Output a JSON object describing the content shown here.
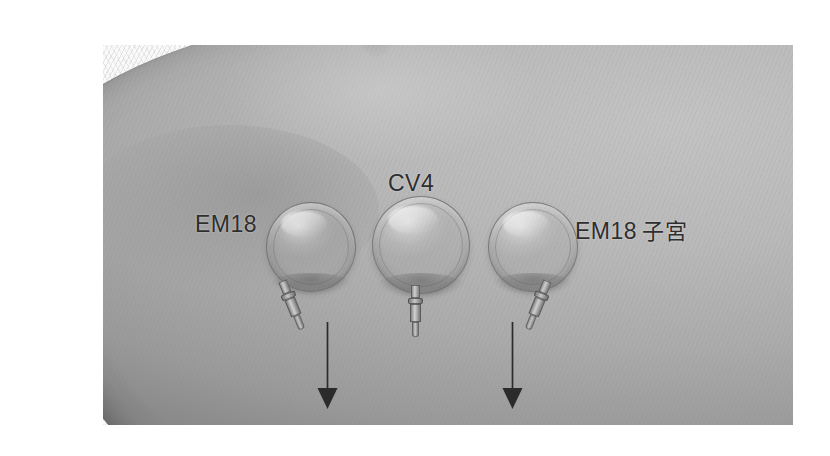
{
  "figure": {
    "kind": "clinical-photograph",
    "modality": "grayscale photo",
    "background_color": "#ffffff"
  },
  "annotations": {
    "labels": [
      {
        "id": "label-left",
        "text": "EM18",
        "cjk": "",
        "x": 195,
        "y": 211,
        "points_to": "cup-left"
      },
      {
        "id": "label-center",
        "text": "CV4",
        "cjk": "",
        "x": 388,
        "y": 170,
        "points_to": "cup-center"
      },
      {
        "id": "label-right",
        "text": "EM18",
        "cjk": "子宮",
        "x": 575,
        "y": 213,
        "points_to": "cup-right"
      }
    ],
    "arrows": [
      {
        "id": "arrow-left",
        "direction": "down",
        "x": 327,
        "y_start": 322,
        "y_end": 409,
        "color": "#2b2b2b"
      },
      {
        "id": "arrow-right",
        "direction": "down",
        "x": 512,
        "y_start": 322,
        "y_end": 409,
        "color": "#2b2b2b"
      }
    ]
  },
  "cups": [
    {
      "id": "cup-left",
      "label": "EM18",
      "cx": 310,
      "cy": 246,
      "r": 44,
      "valve_angle_deg": -22
    },
    {
      "id": "cup-center",
      "label": "CV4",
      "cx": 420,
      "cy": 244,
      "r": 48,
      "valve_angle_deg": 0
    },
    {
      "id": "cup-right",
      "label": "EM18 子宮",
      "cx": 532,
      "cy": 246,
      "r": 44,
      "valve_angle_deg": 22
    }
  ],
  "anatomy": {
    "navel": {
      "cx": 437,
      "cy": 78
    },
    "skin_tone": "#b4b4b4",
    "drape_tone": "#f7f7f7"
  },
  "plate": {
    "x": 103,
    "y": 45,
    "width": 690,
    "height": 380
  }
}
